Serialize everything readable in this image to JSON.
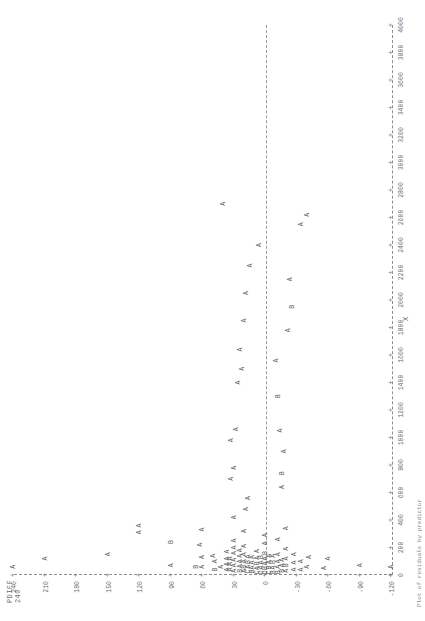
{
  "chart_data": {
    "type": "scatter",
    "title": "",
    "ylabel": "PDIFF",
    "xlabel": "X",
    "ylim": [
      -120,
      240
    ],
    "xlim": [
      0,
      4000
    ],
    "grid": false,
    "legend": null,
    "y_ticks": [
      240,
      210,
      180,
      150,
      120,
      90,
      60,
      30,
      0,
      -30,
      -60,
      -90,
      -120
    ],
    "x_ticks": [
      0,
      200,
      400,
      600,
      800,
      1000,
      1200,
      1400,
      1600,
      1800,
      2000,
      2200,
      2400,
      2600,
      2800,
      3000,
      3200,
      3400,
      3600,
      3800,
      4000
    ],
    "reference_line_y": 0,
    "point_symbol_note": "A=1 obs, B=2 obs, C=3 obs, D=4 obs",
    "points": [
      {
        "x": 60,
        "y": 240,
        "s": "A"
      },
      {
        "x": 120,
        "y": 210,
        "s": "A"
      },
      {
        "x": 150,
        "y": 150,
        "s": "A"
      },
      {
        "x": 310,
        "y": 120,
        "s": "A"
      },
      {
        "x": 360,
        "y": 120,
        "s": "A"
      },
      {
        "x": 70,
        "y": 90,
        "s": "A"
      },
      {
        "x": 240,
        "y": 90,
        "s": "B"
      },
      {
        "x": 60,
        "y": 66,
        "s": "B"
      },
      {
        "x": 60,
        "y": 60,
        "s": "A"
      },
      {
        "x": 130,
        "y": 60,
        "s": "A"
      },
      {
        "x": 220,
        "y": 62,
        "s": "A"
      },
      {
        "x": 330,
        "y": 60,
        "s": "A"
      },
      {
        "x": 40,
        "y": 48,
        "s": "B"
      },
      {
        "x": 100,
        "y": 48,
        "s": "A"
      },
      {
        "x": 140,
        "y": 50,
        "s": "A"
      },
      {
        "x": 60,
        "y": 42,
        "s": "A"
      },
      {
        "x": 40,
        "y": 36,
        "s": "A"
      },
      {
        "x": 80,
        "y": 36,
        "s": "A"
      },
      {
        "x": 120,
        "y": 36,
        "s": "A"
      },
      {
        "x": 170,
        "y": 36,
        "s": "A"
      },
      {
        "x": 40,
        "y": 33,
        "s": "A"
      },
      {
        "x": 80,
        "y": 33,
        "s": "A"
      },
      {
        "x": 120,
        "y": 33,
        "s": "A"
      },
      {
        "x": 30,
        "y": 30,
        "s": "A"
      },
      {
        "x": 70,
        "y": 30,
        "s": "A"
      },
      {
        "x": 110,
        "y": 30,
        "s": "A"
      },
      {
        "x": 160,
        "y": 30,
        "s": "A"
      },
      {
        "x": 200,
        "y": 30,
        "s": "A"
      },
      {
        "x": 250,
        "y": 30,
        "s": "A"
      },
      {
        "x": 420,
        "y": 30,
        "s": "A"
      },
      {
        "x": 700,
        "y": 32,
        "s": "A"
      },
      {
        "x": 780,
        "y": 30,
        "s": "A"
      },
      {
        "x": 980,
        "y": 32,
        "s": "A"
      },
      {
        "x": 1060,
        "y": 28,
        "s": "A"
      },
      {
        "x": 1400,
        "y": 26,
        "s": "A"
      },
      {
        "x": 1500,
        "y": 22,
        "s": "A"
      },
      {
        "x": 1640,
        "y": 24,
        "s": "A"
      },
      {
        "x": 1850,
        "y": 20,
        "s": "A"
      },
      {
        "x": 2050,
        "y": 18,
        "s": "A"
      },
      {
        "x": 2250,
        "y": 14,
        "s": "A"
      },
      {
        "x": 2700,
        "y": 40,
        "s": "A"
      },
      {
        "x": 2400,
        "y": 6,
        "s": "A"
      },
      {
        "x": 30,
        "y": 24,
        "s": "B"
      },
      {
        "x": 65,
        "y": 24,
        "s": "A"
      },
      {
        "x": 100,
        "y": 24,
        "s": "A"
      },
      {
        "x": 140,
        "y": 24,
        "s": "A"
      },
      {
        "x": 180,
        "y": 24,
        "s": "A"
      },
      {
        "x": 30,
        "y": 20,
        "s": "A"
      },
      {
        "x": 60,
        "y": 20,
        "s": "B"
      },
      {
        "x": 100,
        "y": 20,
        "s": "A"
      },
      {
        "x": 150,
        "y": 20,
        "s": "A"
      },
      {
        "x": 210,
        "y": 20,
        "s": "A"
      },
      {
        "x": 320,
        "y": 20,
        "s": "A"
      },
      {
        "x": 480,
        "y": 18,
        "s": "A"
      },
      {
        "x": 560,
        "y": 16,
        "s": "A"
      },
      {
        "x": 25,
        "y": 16,
        "s": "C"
      },
      {
        "x": 60,
        "y": 16,
        "s": "A"
      },
      {
        "x": 95,
        "y": 16,
        "s": "B"
      },
      {
        "x": 135,
        "y": 16,
        "s": "A"
      },
      {
        "x": 25,
        "y": 12,
        "s": "B"
      },
      {
        "x": 55,
        "y": 12,
        "s": "A"
      },
      {
        "x": 90,
        "y": 12,
        "s": "A"
      },
      {
        "x": 130,
        "y": 12,
        "s": "A"
      },
      {
        "x": 20,
        "y": 8,
        "s": "C"
      },
      {
        "x": 50,
        "y": 8,
        "s": "A"
      },
      {
        "x": 85,
        "y": 8,
        "s": "B"
      },
      {
        "x": 125,
        "y": 8,
        "s": "A"
      },
      {
        "x": 175,
        "y": 8,
        "s": "A"
      },
      {
        "x": 20,
        "y": 4,
        "s": "D"
      },
      {
        "x": 55,
        "y": 4,
        "s": "A"
      },
      {
        "x": 90,
        "y": 4,
        "s": "A"
      },
      {
        "x": 130,
        "y": 4,
        "s": "B"
      },
      {
        "x": 20,
        "y": 0,
        "s": "D"
      },
      {
        "x": 50,
        "y": 0,
        "s": "B"
      },
      {
        "x": 85,
        "y": 0,
        "s": "A"
      },
      {
        "x": 120,
        "y": 0,
        "s": "A"
      },
      {
        "x": 160,
        "y": 0,
        "s": "B"
      },
      {
        "x": 230,
        "y": 0,
        "s": "A"
      },
      {
        "x": 290,
        "y": 0,
        "s": "A"
      },
      {
        "x": 20,
        "y": -4,
        "s": "C"
      },
      {
        "x": 55,
        "y": -4,
        "s": "B"
      },
      {
        "x": 95,
        "y": -4,
        "s": "A"
      },
      {
        "x": 140,
        "y": -4,
        "s": "A"
      },
      {
        "x": 20,
        "y": -8,
        "s": "B"
      },
      {
        "x": 55,
        "y": -8,
        "s": "A"
      },
      {
        "x": 95,
        "y": -8,
        "s": "B"
      },
      {
        "x": 140,
        "y": -8,
        "s": "A"
      },
      {
        "x": 20,
        "y": -12,
        "s": "B"
      },
      {
        "x": 60,
        "y": -12,
        "s": "A"
      },
      {
        "x": 100,
        "y": -12,
        "s": "A"
      },
      {
        "x": 150,
        "y": -12,
        "s": "A"
      },
      {
        "x": 260,
        "y": -12,
        "s": "A"
      },
      {
        "x": 30,
        "y": -16,
        "s": "B"
      },
      {
        "x": 70,
        "y": -16,
        "s": "A"
      },
      {
        "x": 110,
        "y": -16,
        "s": "A"
      },
      {
        "x": 30,
        "y": -20,
        "s": "A"
      },
      {
        "x": 70,
        "y": -20,
        "s": "B"
      },
      {
        "x": 120,
        "y": -20,
        "s": "A"
      },
      {
        "x": 190,
        "y": -20,
        "s": "A"
      },
      {
        "x": 340,
        "y": -20,
        "s": "A"
      },
      {
        "x": 640,
        "y": -16,
        "s": "A"
      },
      {
        "x": 740,
        "y": -16,
        "s": "B"
      },
      {
        "x": 900,
        "y": -18,
        "s": "A"
      },
      {
        "x": 1050,
        "y": -14,
        "s": "A"
      },
      {
        "x": 1300,
        "y": -12,
        "s": "B"
      },
      {
        "x": 1560,
        "y": -10,
        "s": "A"
      },
      {
        "x": 1780,
        "y": -22,
        "s": "A"
      },
      {
        "x": 1950,
        "y": -26,
        "s": "B"
      },
      {
        "x": 2150,
        "y": -24,
        "s": "A"
      },
      {
        "x": 2550,
        "y": -34,
        "s": "A"
      },
      {
        "x": 2620,
        "y": -40,
        "s": "A"
      },
      {
        "x": 40,
        "y": -28,
        "s": "A"
      },
      {
        "x": 90,
        "y": -28,
        "s": "A"
      },
      {
        "x": 150,
        "y": -28,
        "s": "A"
      },
      {
        "x": 40,
        "y": -34,
        "s": "A"
      },
      {
        "x": 100,
        "y": -34,
        "s": "A"
      },
      {
        "x": 60,
        "y": -40,
        "s": "A"
      },
      {
        "x": 130,
        "y": -42,
        "s": "A"
      },
      {
        "x": 50,
        "y": -56,
        "s": "A"
      },
      {
        "x": 120,
        "y": -60,
        "s": "A"
      },
      {
        "x": 70,
        "y": -90,
        "s": "A"
      },
      {
        "x": 60,
        "y": -120,
        "s": "A"
      }
    ]
  },
  "axes": {
    "y_title": "PDIFF",
    "y_top_value": "240",
    "x_title": "X"
  },
  "caption": "Plot of residuals by predictor",
  "tick_glyph": "+",
  "dash_glyph": "-"
}
